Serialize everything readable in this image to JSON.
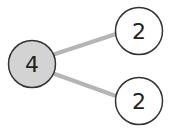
{
  "diagram": {
    "type": "number-bond",
    "whole": {
      "value": "4",
      "fill": "#d3d3d3",
      "stroke": "#333333"
    },
    "parts": [
      {
        "value": "2",
        "fill": "#ffffff",
        "stroke": "#333333"
      },
      {
        "value": "2",
        "fill": "#ffffff",
        "stroke": "#333333"
      }
    ],
    "connector_color": "#b5b5b5"
  }
}
